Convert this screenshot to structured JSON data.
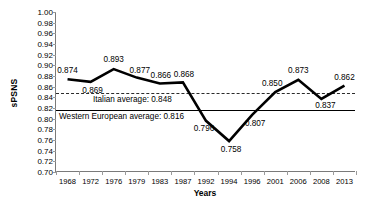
{
  "chart_data": {
    "type": "line",
    "title": "",
    "xlabel": "Years",
    "ylabel": "sPSNS",
    "categories": [
      "1968",
      "1972",
      "1976",
      "1979",
      "1983",
      "1987",
      "1992",
      "1994",
      "1996",
      "2001",
      "2006",
      "2008",
      "2013"
    ],
    "values": [
      0.874,
      0.869,
      0.893,
      0.877,
      0.866,
      0.868,
      0.796,
      0.758,
      0.807,
      0.85,
      0.873,
      0.837,
      0.862
    ],
    "point_labels": [
      "0.874",
      "0.869",
      "0.893",
      "0.877",
      "0.866",
      "0.868",
      "0.796",
      "0.758",
      "0.807",
      "0.850",
      "0.873",
      "0.837",
      "0.862"
    ],
    "ylim": [
      0.7,
      1.0
    ],
    "ytick_step": 0.02,
    "ytick_labels": [
      "1.00",
      "0.98",
      "0.96",
      "0.94",
      "0.92",
      "0.90",
      "0.88",
      "0.86",
      "0.84",
      "0.82",
      "0.80",
      "0.78",
      "0.76",
      "0.74",
      "0.72",
      "0.70"
    ],
    "grid": false,
    "legend": "none",
    "series_color": "#000000",
    "reference_lines": [
      {
        "label": "Italian average: 0.848",
        "value": 0.848,
        "style": "dashed",
        "color": "#2b2b2b"
      },
      {
        "label": "Western European average: 0.816",
        "value": 0.816,
        "style": "solid",
        "color": "#000000"
      }
    ]
  }
}
